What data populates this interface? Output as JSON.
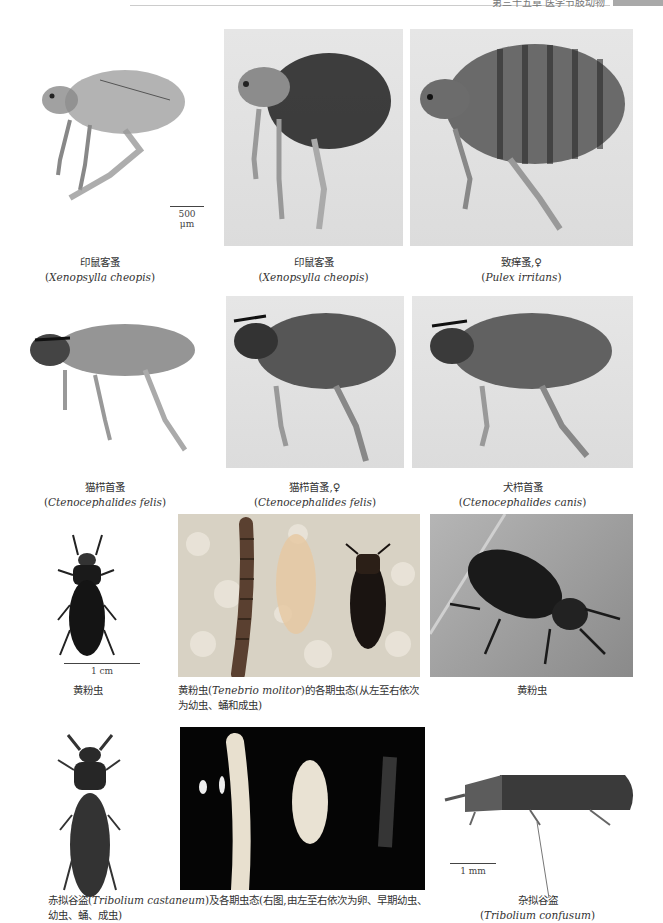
{
  "page_header": {
    "running_title": "第三十五章  医学节肢动物",
    "page_tab_color": "#a9a9a9"
  },
  "rows": [
    {
      "figures": [
        {
          "id": "fig1",
          "cn": "印鼠客蚤",
          "latin": "Xenopsylla cheopis",
          "scale": "500 μm",
          "background": "white",
          "subject": "flea"
        },
        {
          "id": "fig2",
          "cn": "印鼠客蚤",
          "latin": "Xenopsylla cheopis",
          "background": "gray",
          "subject": "flea"
        },
        {
          "id": "fig3",
          "cn": "致痒蚤,♀",
          "latin": "Pulex irritans",
          "background": "gray",
          "subject": "flea"
        }
      ]
    },
    {
      "figures": [
        {
          "id": "fig4",
          "cn": "猫栉首蚤",
          "latin": "Ctenocephalides felis",
          "background": "white",
          "subject": "flea"
        },
        {
          "id": "fig5",
          "cn": "猫栉首蚤,♀",
          "latin": "Ctenocephalides felis",
          "background": "gray",
          "subject": "flea"
        },
        {
          "id": "fig6",
          "cn": "犬栉首蚤",
          "latin": "Ctenocephalides canis",
          "background": "gray",
          "subject": "flea"
        }
      ]
    },
    {
      "figures": [
        {
          "id": "fig7",
          "cn": "黄粉虫",
          "scale": "1 cm",
          "background": "white",
          "subject": "beetle"
        },
        {
          "id": "fig8",
          "caption_pre": "黄粉虫(",
          "latin": "Tenebrio molitor",
          "caption_post": ")的各期虫态(从左至右依次为幼虫、蛹和成虫)",
          "background": "sawdust",
          "subject": "larva-pupa-adult"
        },
        {
          "id": "fig9",
          "cn": "黄粉虫",
          "background": "wood",
          "subject": "beetle"
        }
      ]
    },
    {
      "figures": [
        {
          "id": "fig10",
          "caption_pre": "赤拟谷盗(",
          "latin": "Tribolium castaneum",
          "caption_post": ")及各期虫态(右图,由左至右依次为卵、早期幼虫、幼虫、蛹、成虫)",
          "background": "white",
          "subject": "beetle"
        },
        {
          "id": "fig11",
          "background": "black",
          "subject": "egg-larva-pupa-adult"
        },
        {
          "id": "fig12",
          "cn": "杂拟谷盗",
          "latin": "Tribolium confusum",
          "scale": "1 mm",
          "background": "white",
          "subject": "beetle-side"
        }
      ]
    }
  ]
}
